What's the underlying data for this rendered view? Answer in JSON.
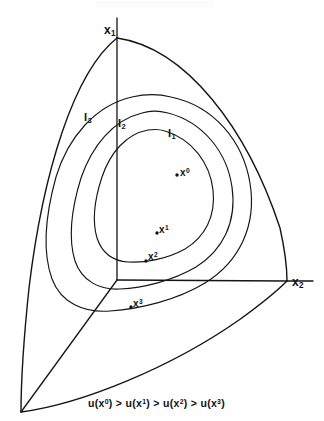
{
  "figure": {
    "type": "indifference-curve-simplex-diagram",
    "background_color": "#ffffff",
    "ink_color": "#151515"
  },
  "axes": [
    {
      "id": "x1",
      "label_text": "x",
      "label_sub": "1",
      "name": "axis-label-x1",
      "x": 104,
      "y": 24
    },
    {
      "id": "x2",
      "label_text": "x",
      "label_sub": "2",
      "name": "axis-label-x2",
      "x": 292,
      "y": 276
    },
    {
      "id": "x3",
      "label_text": "",
      "label_sub": "",
      "name": "axis-label-x3",
      "x": 0,
      "y": 0
    }
  ],
  "curve_labels": [
    {
      "id": "I1",
      "text": "I",
      "sub": "1",
      "x": 168,
      "y": 128
    },
    {
      "id": "I2",
      "text": "I",
      "sub": "2",
      "x": 118,
      "y": 118
    },
    {
      "id": "I3",
      "text": "I",
      "sub": "3",
      "x": 84,
      "y": 112
    }
  ],
  "points": [
    {
      "id": "x0",
      "text": "x",
      "sup": "0",
      "label_x": 180,
      "label_y": 168,
      "dot_x": 177,
      "dot_y": 175
    },
    {
      "id": "x1",
      "text": "x",
      "sup": "1",
      "label_x": 159,
      "label_y": 225,
      "dot_x": 156,
      "dot_y": 233
    },
    {
      "id": "x2",
      "text": "x",
      "sup": "2",
      "label_x": 148,
      "label_y": 252,
      "dot_x": 146,
      "dot_y": 261
    },
    {
      "id": "x3",
      "text": "x",
      "sup": "3",
      "label_x": 133,
      "label_y": 299,
      "dot_x": 131,
      "dot_y": 307
    }
  ],
  "caption": {
    "name": "preference-ordering-caption",
    "full_text": "u(x0) > u(x1) > u(x2) > u(x3)",
    "segments": [
      {
        "fn": "u(x",
        "sup": "0",
        "close": ")",
        "rel": " > "
      },
      {
        "fn": "u(x",
        "sup": "1",
        "close": ")",
        "rel": " > "
      },
      {
        "fn": "u(x",
        "sup": "2",
        "close": ")",
        "rel": " > "
      },
      {
        "fn": "u(x",
        "sup": "3",
        "close": ")",
        "rel": ""
      }
    ],
    "x": 88,
    "y": 398
  },
  "geometry": {
    "origin": {
      "x": 117,
      "y": 280
    },
    "vertex_top": {
      "x": 117,
      "y": 38
    },
    "vertex_right": {
      "x": 287,
      "y": 281
    },
    "vertex_bottomleft": {
      "x": 21,
      "y": 412
    }
  }
}
